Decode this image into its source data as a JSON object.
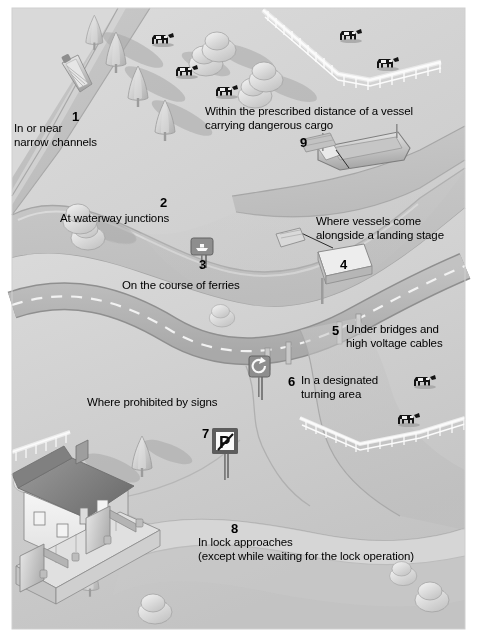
{
  "diagram": {
    "style": "grayscale isometric illustration",
    "colors": {
      "paper": "#ffffff",
      "land_light": "#d8d8d8",
      "land_mid": "#c6c6c6",
      "land_dark": "#b4b4b4",
      "water": "#cfcfcf",
      "water_shadow": "#bdbdbd",
      "road": "#b8b8b8",
      "road_edge": "#8f8f8f",
      "sign_panel": "#8a8a8a",
      "sign_dark": "#5d5d5d",
      "white": "#f4f4f4",
      "ink": "#000000",
      "cow": "#1a1a1a",
      "shadow": "#a9a9a9"
    },
    "labels": [
      {
        "number": "1",
        "lines": [
          "In or near",
          "narrow channels"
        ],
        "num_x": 72,
        "num_y": 110,
        "text_x": 14,
        "text_y": 122,
        "align": "left"
      },
      {
        "number": "2",
        "lines": [
          "At waterway junctions"
        ],
        "num_x": 160,
        "num_y": 196,
        "text_x": 60,
        "text_y": 212,
        "align": "left"
      },
      {
        "number": "3",
        "lines": [
          "On the course of ferries"
        ],
        "num_x": 199,
        "num_y": 258,
        "text_x": 122,
        "text_y": 279,
        "align": "left"
      },
      {
        "number": "4",
        "lines": [
          "Where vessels come",
          "alongside a landing stage"
        ],
        "num_x": 340,
        "num_y": 258,
        "text_x": 316,
        "text_y": 215,
        "align": "left"
      },
      {
        "number": "5",
        "lines": [
          "Under bridges and",
          "high voltage cables"
        ],
        "num_x": 332,
        "num_y": 324,
        "text_x": 346,
        "text_y": 324,
        "align": "left"
      },
      {
        "number": "6",
        "lines": [
          "In a designated",
          "turning area"
        ],
        "num_x": 288,
        "num_y": 375,
        "text_x": 301,
        "text_y": 375,
        "align": "left"
      },
      {
        "number": "7",
        "lines": [
          "Where prohibited by signs"
        ],
        "num_x": 202,
        "num_y": 427,
        "text_x": 87,
        "text_y": 396,
        "align": "left"
      },
      {
        "number": "8",
        "lines": [
          "In lock approaches",
          "(except while waiting for the lock operation)"
        ],
        "num_x": 231,
        "num_y": 522,
        "text_x": 198,
        "text_y": 536,
        "align": "left"
      },
      {
        "number": "9",
        "lines": [
          "Within the prescribed distance of a vessel",
          "carrying dangerous cargo"
        ],
        "num_x": 300,
        "num_y": 136,
        "text_x": 205,
        "text_y": 106,
        "align": "left"
      }
    ],
    "signs": [
      {
        "name": "ferry-crossing-sign",
        "glyph": "ferry-boat",
        "x": 191,
        "y": 238
      },
      {
        "name": "turning-area-sign",
        "glyph": "turning-circle-arrow",
        "x": 249,
        "y": 360
      },
      {
        "name": "no-mooring-sign",
        "glyph": "crossed-P",
        "x": 212,
        "y": 432
      }
    ],
    "features": [
      {
        "name": "narrow-boat",
        "label_ref": "1"
      },
      {
        "name": "cargo-vessel",
        "label_ref": "9"
      },
      {
        "name": "landing-stage",
        "label_ref": "4"
      },
      {
        "name": "road-bridge",
        "label_ref": "5"
      },
      {
        "name": "lock-house",
        "label_ref": "8"
      },
      {
        "name": "lock-gates",
        "label_ref": "8"
      },
      {
        "name": "picket-fence",
        "count": 2
      },
      {
        "name": "cow",
        "count": 8
      },
      {
        "name": "conifer-tree",
        "count": 7
      },
      {
        "name": "bush",
        "count": 10
      }
    ]
  }
}
